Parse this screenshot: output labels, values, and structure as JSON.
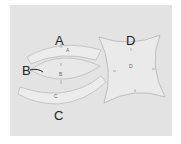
{
  "diagram": {
    "title": "",
    "background": "#e3e3e3",
    "piece_fill": "#ececec",
    "piece_stroke": "#b8b8b8",
    "labels": {
      "a": "A",
      "b": "B",
      "c": "C",
      "d": "D"
    },
    "piece_marks": {
      "a": "A",
      "b": "B",
      "c": "C",
      "d": "D"
    }
  }
}
